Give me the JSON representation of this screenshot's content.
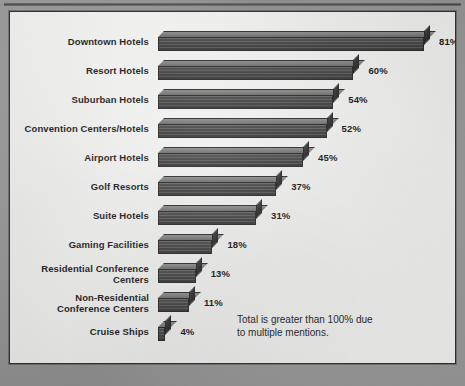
{
  "chart_data": {
    "type": "bar",
    "orientation": "horizontal",
    "title": "",
    "xlabel": "",
    "ylabel": "",
    "xlim": [
      0,
      81
    ],
    "grid": false,
    "legend": "none",
    "value_suffix": "%",
    "categories": [
      "Downtown Hotels",
      "Resort Hotels",
      "Suburban Hotels",
      "Convention Centers/Hotels",
      "Airport Hotels",
      "Golf Resorts",
      "Suite Hotels",
      "Gaming Facilities",
      "Residential Conference\nCenters",
      "Non-Residential\nConference Centers",
      "Cruise Ships"
    ],
    "values": [
      81,
      60,
      54,
      52,
      45,
      37,
      31,
      18,
      13,
      11,
      4
    ],
    "value_labels": [
      "81%",
      "60%",
      "54%",
      "52%",
      "45%",
      "37%",
      "31%",
      "18%",
      "13%",
      "11%",
      "4%"
    ],
    "annotation": "Total is greater than 100% due\nto multiple mentions.",
    "colors": {
      "bar_front": "#4a4a4a",
      "bar_top": "#7d7d7d",
      "bar_side": "#2b2b2b",
      "panel_background": "#fbfbfa",
      "frame": "#979797",
      "text": "#1b1b1b"
    }
  }
}
